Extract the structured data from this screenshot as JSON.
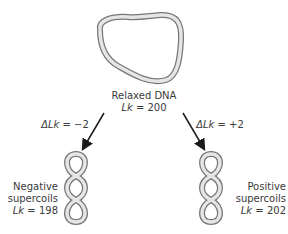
{
  "relaxed": {
    "title": "Relaxed DNA",
    "lk_var": "Lk",
    "lk_eq": " = 200"
  },
  "left_arrow": {
    "label_var": "ΔLk",
    "label_eq": " = −2"
  },
  "right_arrow": {
    "label_var": "ΔLk",
    "label_eq": " = +2"
  },
  "negative": {
    "line1": "Negative",
    "line2": "supercoils",
    "lk_var": "Lk",
    "lk_eq": " = 198"
  },
  "positive": {
    "line1": "Positive",
    "line2": "supercoils",
    "lk_var": "Lk",
    "lk_eq": " = 202"
  },
  "colors": {
    "strand_outer": "#777777",
    "strand_inner": "#e6e6e6",
    "arrow": "#1a1a1a"
  }
}
